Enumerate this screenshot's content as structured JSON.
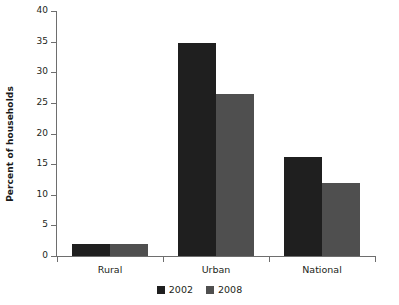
{
  "chart_data": {
    "type": "bar",
    "title": "",
    "subtitle": "",
    "xlabel": "",
    "ylabel": "Percent of households",
    "ylim": [
      0,
      40
    ],
    "yticks": [
      0,
      5,
      10,
      15,
      20,
      25,
      30,
      35,
      40
    ],
    "ytick_labels": [
      "0",
      "5",
      "10",
      "15",
      "20",
      "25",
      "30",
      "35",
      "40"
    ],
    "grid": false,
    "legend_position": "bottom-center",
    "categories": [
      "Rural",
      "Urban",
      "National"
    ],
    "series": [
      {
        "name": "2002",
        "color": "#1f1f1f",
        "values": [
          2.0,
          34.8,
          16.1
        ]
      },
      {
        "name": "2008",
        "color": "#4f4f4f",
        "values": [
          2.0,
          26.5,
          12.0
        ]
      }
    ]
  },
  "legend": {
    "items": [
      {
        "label": "2002",
        "color": "#1f1f1f"
      },
      {
        "label": "2008",
        "color": "#4f4f4f"
      }
    ]
  },
  "axis": {
    "line_color": "#6e6e6e",
    "tick_color": "#6e6e6e"
  }
}
